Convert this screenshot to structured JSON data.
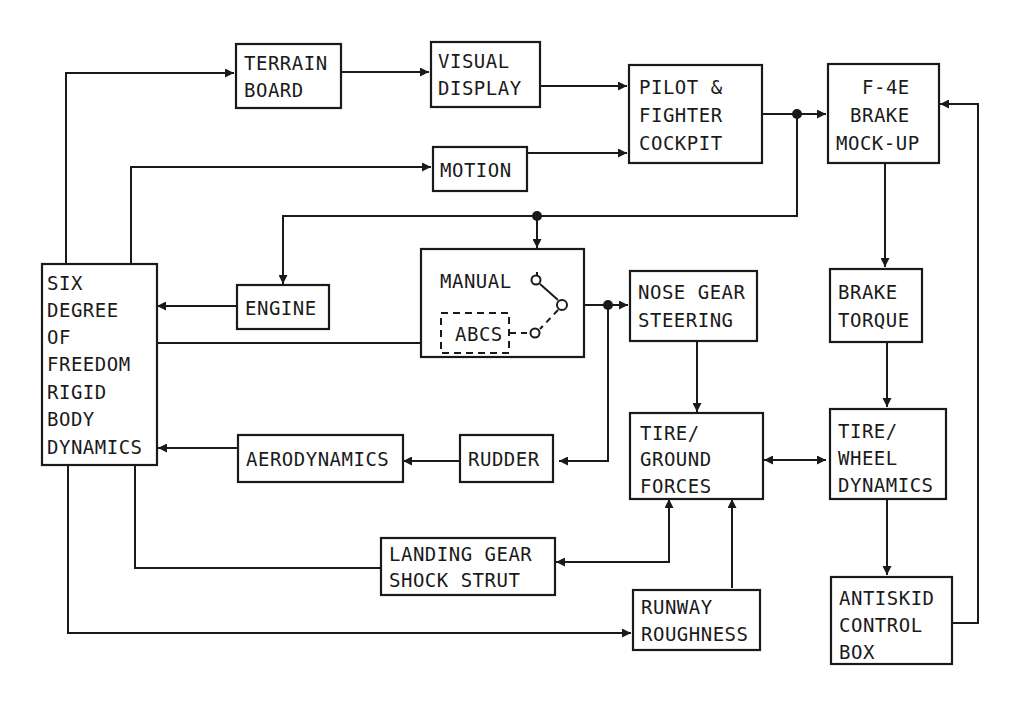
{
  "diagram": {
    "type": "block-diagram",
    "blocks": {
      "terrain_board": {
        "line1": "TERRAIN",
        "line2": "BOARD"
      },
      "visual_display": {
        "line1": "VISUAL",
        "line2": "DISPLAY"
      },
      "pilot_cockpit": {
        "line1": "PILOT &",
        "line2": "FIGHTER",
        "line3": "COCKPIT"
      },
      "brake_mockup": {
        "line1": "F-4E",
        "line2": "BRAKE",
        "line3": "MOCK-UP"
      },
      "motion": {
        "line1": "MOTION"
      },
      "six_dof": {
        "line1": "SIX",
        "line2": "DEGREE",
        "line3": "OF",
        "line4": "FREEDOM",
        "line5": "RIGID",
        "line6": "BODY",
        "line7": "DYNAMICS"
      },
      "engine": {
        "line1": "ENGINE"
      },
      "switch_box": {
        "manual": "MANUAL",
        "abcs": "ABCS"
      },
      "nose_gear": {
        "line1": "NOSE GEAR",
        "line2": "STEERING"
      },
      "brake_torque": {
        "line1": "BRAKE",
        "line2": "TORQUE"
      },
      "aerodynamics": {
        "line1": "AERODYNAMICS"
      },
      "rudder": {
        "line1": "RUDDER"
      },
      "tire_ground": {
        "line1": "TIRE/",
        "line2": "GROUND",
        "line3": "FORCES"
      },
      "tire_wheel": {
        "line1": "TIRE/",
        "line2": "WHEEL",
        "line3": "DYNAMICS"
      },
      "landing_gear": {
        "line1": "LANDING GEAR",
        "line2": "SHOCK STRUT"
      },
      "runway": {
        "line1": "RUNWAY",
        "line2": "ROUGHNESS"
      },
      "antiskid": {
        "line1": "ANTISKID",
        "line2": "CONTROL",
        "line3": "BOX"
      }
    },
    "connections": [
      {
        "from": "SIX DEGREE OF FREEDOM RIGID BODY DYNAMICS",
        "to": "TERRAIN BOARD"
      },
      {
        "from": "TERRAIN BOARD",
        "to": "VISUAL DISPLAY"
      },
      {
        "from": "VISUAL DISPLAY",
        "to": "PILOT & FIGHTER COCKPIT"
      },
      {
        "from": "SIX DEGREE OF FREEDOM RIGID BODY DYNAMICS",
        "to": "MOTION"
      },
      {
        "from": "MOTION",
        "to": "PILOT & FIGHTER COCKPIT"
      },
      {
        "from": "PILOT & FIGHTER COCKPIT",
        "to": "F-4E BRAKE MOCK-UP"
      },
      {
        "from": "PILOT & FIGHTER COCKPIT",
        "to": "ENGINE"
      },
      {
        "from": "PILOT & FIGHTER COCKPIT",
        "to": "MANUAL switch"
      },
      {
        "from": "ENGINE",
        "to": "SIX DEGREE OF FREEDOM RIGID BODY DYNAMICS"
      },
      {
        "from": "SIX DEGREE OF FREEDOM RIGID BODY DYNAMICS",
        "to": "ABCS"
      },
      {
        "from": "switch",
        "to": "NOSE GEAR STEERING"
      },
      {
        "from": "switch",
        "to": "RUDDER"
      },
      {
        "from": "RUDDER",
        "to": "AERODYNAMICS"
      },
      {
        "from": "AERODYNAMICS",
        "to": "SIX DEGREE OF FREEDOM RIGID BODY DYNAMICS"
      },
      {
        "from": "NOSE GEAR STEERING",
        "to": "TIRE/GROUND FORCES"
      },
      {
        "from": "F-4E BRAKE MOCK-UP",
        "to": "BRAKE TORQUE"
      },
      {
        "from": "BRAKE TORQUE",
        "to": "TIRE/WHEEL DYNAMICS"
      },
      {
        "from": "TIRE/GROUND FORCES",
        "to": "TIRE/WHEEL DYNAMICS",
        "bidirectional": true
      },
      {
        "from": "TIRE/WHEEL DYNAMICS",
        "to": "ANTISKID CONTROL BOX"
      },
      {
        "from": "ANTISKID CONTROL BOX",
        "to": "F-4E BRAKE MOCK-UP"
      },
      {
        "from": "SIX DEGREE OF FREEDOM RIGID BODY DYNAMICS",
        "to": "LANDING GEAR SHOCK STRUT"
      },
      {
        "from": "TIRE/GROUND FORCES",
        "to": "LANDING GEAR SHOCK STRUT",
        "bidirectional": true
      },
      {
        "from": "SIX DEGREE OF FREEDOM RIGID BODY DYNAMICS",
        "to": "RUNWAY ROUGHNESS"
      },
      {
        "from": "RUNWAY ROUGHNESS",
        "to": "TIRE/GROUND FORCES"
      }
    ]
  }
}
